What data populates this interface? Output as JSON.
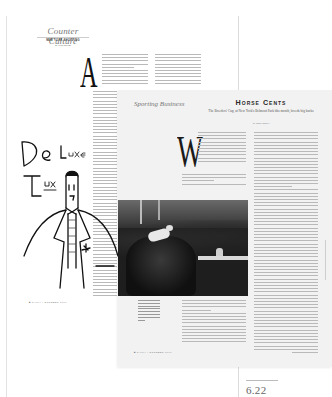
{
  "portfolio": {
    "page_number": "6.22"
  },
  "back_spread": {
    "section_title": "Counter Culture",
    "kicker": "NEW YORK SHOPPING",
    "byline": "by Jessi Mellor",
    "drop_cap": "A",
    "illustration_text_line1": "De Luxe",
    "illustration_text_line2": "Tux",
    "footer": "■  TALKY  |  OCTOBER 1999"
  },
  "front_spread": {
    "section_title": "Sporting Business",
    "headline": "Horse Cents",
    "dek": "The Breeders' Cup, at New York's Belmont Park this month, breeds big bucks",
    "byline": "by Mark Inkster",
    "drop_cap": "W",
    "photo_alt": "Jockey on horse racing past a rail",
    "footer": "■  TALKY  |  OCTOBER 1999"
  },
  "colors": {
    "background": "#ffffff",
    "front_spread_bg": "#f2f2f2",
    "photo_dark": "#1e1e1e",
    "rule": "#dcdcdc"
  }
}
